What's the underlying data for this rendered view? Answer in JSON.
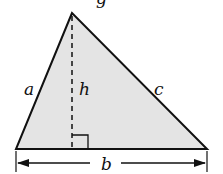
{
  "diagram": {
    "type": "triangle-area",
    "fill_color": "#e4e4e4",
    "stroke_color": "#111111",
    "labels": {
      "side_left": "a",
      "height": "h",
      "side_right": "c",
      "base": "b"
    },
    "top_fragment": "g"
  }
}
